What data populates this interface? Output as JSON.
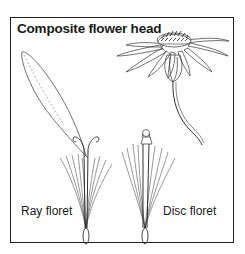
{
  "figure": {
    "title": "Composite flower head",
    "labels": {
      "ray_floret": "Ray floret",
      "disc_floret": "Disc floret"
    },
    "illustrations": [
      {
        "name": "flower-head",
        "description": "Composite flower head with disc and surrounding ray petals on a stem"
      },
      {
        "name": "ray-floret",
        "description": "Single ray floret with elongated ligule, forked style and pappus bristles"
      },
      {
        "name": "disc-floret",
        "description": "Single tubular disc floret with pappus bristles and achene"
      }
    ],
    "colors": {
      "ink": "#222222",
      "background": "#ffffff"
    }
  }
}
